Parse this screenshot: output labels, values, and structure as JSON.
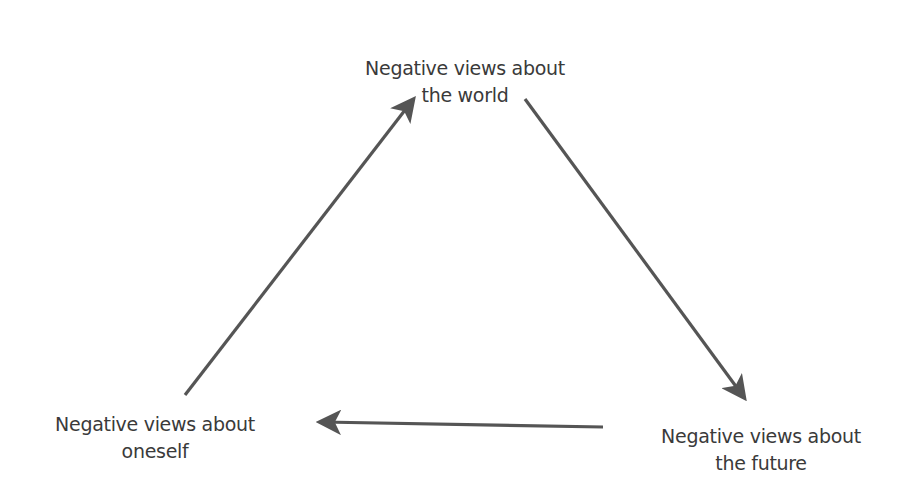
{
  "diagram": {
    "nodes": [
      {
        "id": "world",
        "lines": [
          "Negative views about",
          "the world"
        ]
      },
      {
        "id": "oneself",
        "lines": [
          "Negative views about",
          "oneself"
        ]
      },
      {
        "id": "future",
        "lines": [
          "Negative views about",
          "the future"
        ]
      }
    ],
    "edges": [
      {
        "from": "oneself",
        "to": "world",
        "start": [
          185,
          395
        ],
        "end": [
          416,
          95
        ]
      },
      {
        "from": "world",
        "to": "future",
        "start": [
          525,
          99
        ],
        "end": [
          747,
          402
        ]
      },
      {
        "from": "future",
        "to": "oneself",
        "start": [
          603,
          427
        ],
        "end": [
          315,
          422
        ]
      }
    ],
    "colors": {
      "arrow": "#555555",
      "text": "#3a3a3a",
      "background": "#ffffff"
    }
  }
}
